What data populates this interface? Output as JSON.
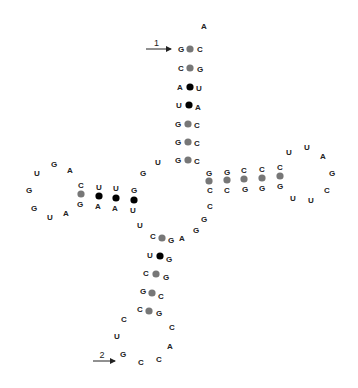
{
  "diagram": {
    "type": "rna-secondary-structure",
    "colors": {
      "gc_pair": "#777777",
      "au_pair": "#000000",
      "gu_pair": "#000000",
      "text": "#222222"
    },
    "strand_labels": [
      {
        "label": "1",
        "x1": 146,
        "x2": 171,
        "y": 49
      },
      {
        "label": "2",
        "x1": 93,
        "x2": 115,
        "y": 361
      }
    ],
    "nucleotides": [
      {
        "b": "A",
        "x": 204,
        "y": 26
      },
      {
        "b": "G",
        "x": 181,
        "y": 49
      },
      {
        "b": "C",
        "x": 200,
        "y": 49
      },
      {
        "b": "C",
        "x": 181,
        "y": 68
      },
      {
        "b": "G",
        "x": 200,
        "y": 69
      },
      {
        "b": "A",
        "x": 180,
        "y": 87
      },
      {
        "b": "U",
        "x": 199,
        "y": 88
      },
      {
        "b": "U",
        "x": 179,
        "y": 105
      },
      {
        "b": "A",
        "x": 198,
        "y": 107
      },
      {
        "b": "G",
        "x": 178,
        "y": 124
      },
      {
        "b": "C",
        "x": 197,
        "y": 125
      },
      {
        "b": "G",
        "x": 178,
        "y": 142
      },
      {
        "b": "C",
        "x": 197,
        "y": 143
      },
      {
        "b": "G",
        "x": 178,
        "y": 160
      },
      {
        "b": "C",
        "x": 197,
        "y": 161
      },
      {
        "b": "U",
        "x": 158,
        "y": 162
      },
      {
        "b": "G",
        "x": 143,
        "y": 173
      },
      {
        "b": "G",
        "x": 134,
        "y": 190
      },
      {
        "b": "U",
        "x": 133,
        "y": 210
      },
      {
        "b": "U",
        "x": 116,
        "y": 188
      },
      {
        "b": "A",
        "x": 115,
        "y": 208
      },
      {
        "b": "U",
        "x": 99,
        "y": 187
      },
      {
        "b": "A",
        "x": 98,
        "y": 206
      },
      {
        "b": "C",
        "x": 81,
        "y": 185
      },
      {
        "b": "G",
        "x": 80,
        "y": 204
      },
      {
        "b": "A",
        "x": 70,
        "y": 170
      },
      {
        "b": "G",
        "x": 54,
        "y": 164
      },
      {
        "b": "U",
        "x": 37,
        "y": 173
      },
      {
        "b": "G",
        "x": 29,
        "y": 190
      },
      {
        "b": "G",
        "x": 34,
        "y": 208
      },
      {
        "b": "U",
        "x": 50,
        "y": 217
      },
      {
        "b": "A",
        "x": 66,
        "y": 213
      },
      {
        "b": "U",
        "x": 140,
        "y": 225
      },
      {
        "b": "C",
        "x": 153,
        "y": 236
      },
      {
        "b": "G",
        "x": 171,
        "y": 240
      },
      {
        "b": "U",
        "x": 150,
        "y": 255
      },
      {
        "b": "G",
        "x": 169,
        "y": 259
      },
      {
        "b": "C",
        "x": 146,
        "y": 273
      },
      {
        "b": "G",
        "x": 166,
        "y": 277
      },
      {
        "b": "G",
        "x": 143,
        "y": 291
      },
      {
        "b": "C",
        "x": 161,
        "y": 296
      },
      {
        "b": "C",
        "x": 140,
        "y": 309
      },
      {
        "b": "G",
        "x": 159,
        "y": 313
      },
      {
        "b": "C",
        "x": 124,
        "y": 319
      },
      {
        "b": "U",
        "x": 117,
        "y": 336
      },
      {
        "b": "G",
        "x": 123,
        "y": 354
      },
      {
        "b": "C",
        "x": 141,
        "y": 362
      },
      {
        "b": "C",
        "x": 159,
        "y": 359
      },
      {
        "b": "A",
        "x": 170,
        "y": 346
      },
      {
        "b": "C",
        "x": 172,
        "y": 327
      },
      {
        "b": "A",
        "x": 182,
        "y": 238
      },
      {
        "b": "G",
        "x": 196,
        "y": 230
      },
      {
        "b": "G",
        "x": 204,
        "y": 219
      },
      {
        "b": "C",
        "x": 210,
        "y": 206
      },
      {
        "b": "G",
        "x": 209,
        "y": 173
      },
      {
        "b": "C",
        "x": 210,
        "y": 190
      },
      {
        "b": "G",
        "x": 227,
        "y": 172
      },
      {
        "b": "C",
        "x": 227,
        "y": 190
      },
      {
        "b": "C",
        "x": 244,
        "y": 170
      },
      {
        "b": "G",
        "x": 245,
        "y": 189
      },
      {
        "b": "C",
        "x": 262,
        "y": 169
      },
      {
        "b": "G",
        "x": 262,
        "y": 188
      },
      {
        "b": "C",
        "x": 280,
        "y": 167
      },
      {
        "b": "G",
        "x": 280,
        "y": 186
      },
      {
        "b": "U",
        "x": 289,
        "y": 152
      },
      {
        "b": "U",
        "x": 307,
        "y": 147
      },
      {
        "b": "A",
        "x": 323,
        "y": 156
      },
      {
        "b": "G",
        "x": 332,
        "y": 173
      },
      {
        "b": "C",
        "x": 327,
        "y": 190
      },
      {
        "b": "U",
        "x": 311,
        "y": 200
      },
      {
        "b": "U",
        "x": 293,
        "y": 198
      }
    ],
    "pairs": [
      {
        "x": 190,
        "y": 49,
        "kind": "GC"
      },
      {
        "x": 190,
        "y": 68,
        "kind": "GC"
      },
      {
        "x": 190,
        "y": 87,
        "kind": "AU"
      },
      {
        "x": 189,
        "y": 105,
        "kind": "AU"
      },
      {
        "x": 188,
        "y": 124,
        "kind": "GC"
      },
      {
        "x": 188,
        "y": 142,
        "kind": "GC"
      },
      {
        "x": 188,
        "y": 160,
        "kind": "GC"
      },
      {
        "x": 134,
        "y": 200,
        "kind": "GU"
      },
      {
        "x": 116,
        "y": 198,
        "kind": "AU"
      },
      {
        "x": 99,
        "y": 196,
        "kind": "AU"
      },
      {
        "x": 81,
        "y": 194,
        "kind": "GC"
      },
      {
        "x": 162,
        "y": 238,
        "kind": "GC"
      },
      {
        "x": 160,
        "y": 256,
        "kind": "GU"
      },
      {
        "x": 156,
        "y": 274,
        "kind": "GC"
      },
      {
        "x": 152,
        "y": 293,
        "kind": "GC"
      },
      {
        "x": 149,
        "y": 311,
        "kind": "GC"
      },
      {
        "x": 209,
        "y": 181,
        "kind": "GC"
      },
      {
        "x": 227,
        "y": 180,
        "kind": "GC"
      },
      {
        "x": 244,
        "y": 179,
        "kind": "GC"
      },
      {
        "x": 262,
        "y": 178,
        "kind": "GC"
      },
      {
        "x": 280,
        "y": 176,
        "kind": "GC"
      }
    ]
  }
}
